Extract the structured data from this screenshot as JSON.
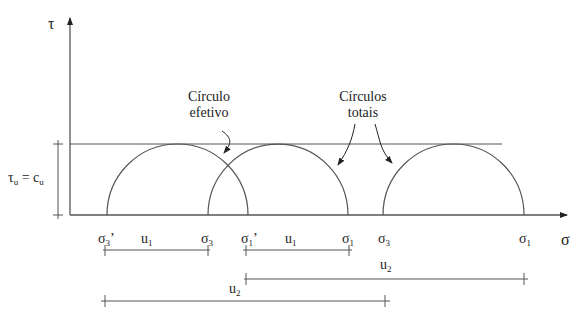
{
  "axes": {
    "y_label": "τ",
    "x_label": "σ"
  },
  "shear_label": {
    "left": "τ",
    "left_sub": "u",
    "eq": " = c",
    "right_sub": "u"
  },
  "annotations": {
    "effective": {
      "line1": "Círculo",
      "line2": "efetivo"
    },
    "total": {
      "line1": "Círculos",
      "line2": "totais"
    }
  },
  "x_ticks": [
    {
      "sym": "σ",
      "sub": "3",
      "prime": "’"
    },
    {
      "sym": "u",
      "sub": "1",
      "prime": ""
    },
    {
      "sym": "σ",
      "sub": "3",
      "prime": ""
    },
    {
      "sym": "σ",
      "sub": "1",
      "prime": "’"
    },
    {
      "sym": "u",
      "sub": "1",
      "prime": ""
    },
    {
      "sym": "σ",
      "sub": "1",
      "prime": ""
    },
    {
      "sym": "σ",
      "sub": "3",
      "prime": ""
    },
    {
      "sym": "σ",
      "sub": "1",
      "prime": ""
    }
  ],
  "dimensions": {
    "u2_upper": {
      "sym": "u",
      "sub": "2"
    },
    "u2_lower": {
      "sym": "u",
      "sub": "2"
    }
  },
  "colors": {
    "line": "#555555",
    "text": "#222222"
  }
}
